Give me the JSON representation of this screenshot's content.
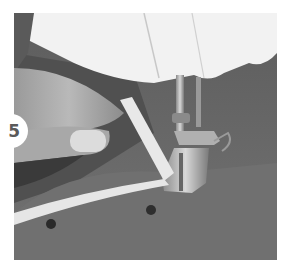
{
  "figure": {
    "step_number": "5",
    "image_description": "Hand guiding fabric with a white ribbon under a sewing machine presser foot; two pins visible in grey felt fabric",
    "colors": {
      "background": "#ffffff",
      "fabric": "#6e6e6e",
      "machine": "#f2f2f2",
      "ribbon": "#e8e8e8",
      "badge": "#ffffff",
      "badge_text": "#5a5a5a"
    }
  }
}
